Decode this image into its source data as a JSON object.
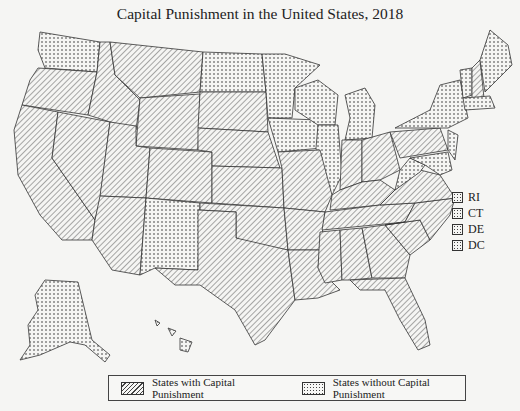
{
  "title": "Capital Punishment in the United States, 2018",
  "legend": {
    "with_label": "States with Capital Punishment",
    "without_label": "States without Capital Punishment"
  },
  "small_states_legend": [
    {
      "label": "RI",
      "status": "without"
    },
    {
      "label": "CT",
      "status": "without"
    },
    {
      "label": "DE",
      "status": "without"
    },
    {
      "label": "DC",
      "status": "without"
    }
  ],
  "patterns": {
    "with": "diagonal-hatch",
    "without": "dots"
  },
  "states_without_capital_punishment": [
    "WA",
    "ND",
    "MN",
    "WI",
    "MI",
    "IA",
    "IL",
    "NM",
    "WV",
    "NY",
    "VT",
    "ME",
    "MA",
    "NJ",
    "MD",
    "AK",
    "HI",
    "RI",
    "CT",
    "DE",
    "DC"
  ],
  "states_with_capital_punishment": [
    "OR",
    "CA",
    "NV",
    "ID",
    "MT",
    "WY",
    "UT",
    "AZ",
    "CO",
    "SD",
    "NE",
    "KS",
    "OK",
    "TX",
    "MO",
    "AR",
    "LA",
    "MS",
    "AL",
    "TN",
    "KY",
    "IN",
    "OH",
    "PA",
    "VA",
    "NC",
    "SC",
    "GA",
    "FL",
    "NH"
  ]
}
